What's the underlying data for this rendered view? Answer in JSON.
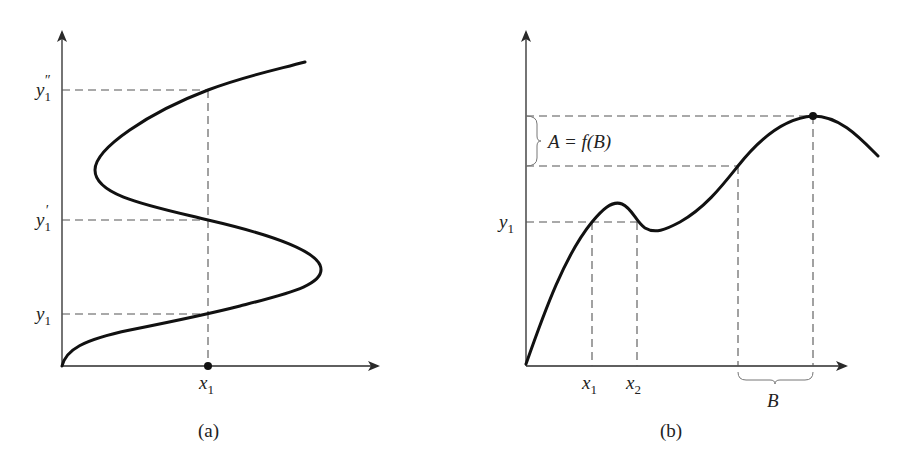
{
  "panels": [
    {
      "id": "a",
      "caption": "(a)",
      "y_labels": [
        {
          "base": "y",
          "sub": "1",
          "prime": "″"
        },
        {
          "base": "y",
          "sub": "1",
          "prime": "′"
        },
        {
          "base": "y",
          "sub": "1",
          "prime": ""
        }
      ],
      "x_labels": [
        {
          "base": "x",
          "sub": "1"
        }
      ],
      "description": "S-shaped curve crossing vertical line x1 at three points y1, y1', y1''"
    },
    {
      "id": "b",
      "caption": "(b)",
      "y_labels": [
        {
          "base": "y",
          "sub": "1"
        }
      ],
      "x_labels": [
        {
          "base": "x",
          "sub": "1"
        },
        {
          "base": "x",
          "sub": "2"
        }
      ],
      "brace_x_label": "B",
      "brace_y_label": "A = f(B)",
      "description": "Curve with local max, local min, then global max; horizontal y1 hits curve at x1 and x2"
    }
  ],
  "colors": {
    "curve": "#111111",
    "axis": "#2a2a2a",
    "dash": "#555555",
    "background": "#ffffff"
  }
}
